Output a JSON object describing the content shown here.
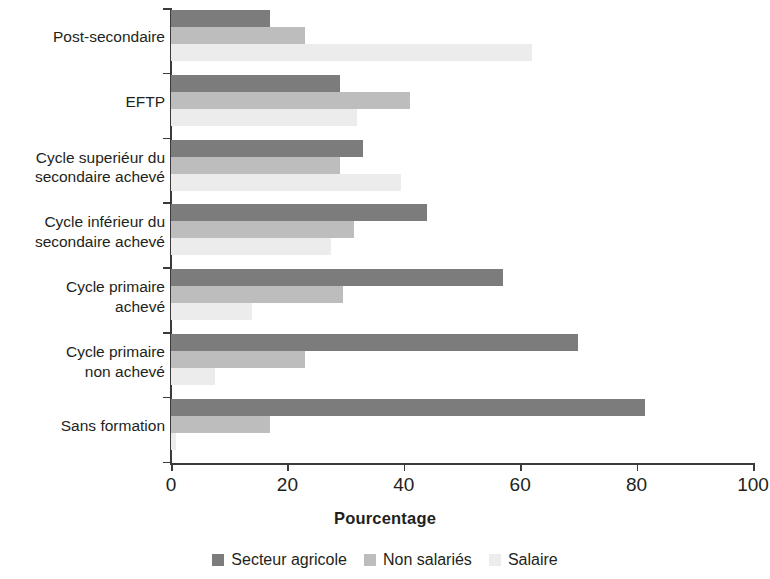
{
  "chart_data": {
    "type": "bar",
    "orientation": "horizontal",
    "title": "",
    "xlabel": "Pourcentage",
    "ylabel": "",
    "xlim": [
      0,
      100
    ],
    "xticks": [
      0,
      20,
      40,
      60,
      80,
      100
    ],
    "xtick_labels": [
      "0",
      "20",
      "40",
      "60",
      "80",
      "100"
    ],
    "grid": false,
    "legend_position": "bottom-center",
    "categories": [
      "Post-secondaire",
      "EFTP",
      "Cycle superiéur du\nsecondaire achevé",
      "Cycle inférieur du\nsecondaire achevé",
      "Cycle primaire\nachevé",
      "Cycle primaire\nnon achevé",
      "Sans formation"
    ],
    "series": [
      {
        "name": "Secteur agricole",
        "color": "#7c7c7c",
        "values": [
          17,
          29,
          33,
          44,
          57,
          70,
          81.5
        ]
      },
      {
        "name": "Non salariés",
        "color": "#bdbdbd",
        "values": [
          23,
          41,
          29,
          31.5,
          29.5,
          23,
          17
        ]
      },
      {
        "name": "Salaire",
        "color": "#ececec",
        "values": [
          62,
          32,
          39.5,
          27.5,
          14,
          7.5,
          0.8
        ]
      }
    ]
  },
  "axis": {
    "x_title": "Pourcentage"
  },
  "colors": {
    "axis": "#3b3b3b",
    "text": "#231f20",
    "background": "#ffffff",
    "series_1": "#7c7c7c",
    "series_2": "#bdbdbd",
    "series_3": "#ececec"
  }
}
